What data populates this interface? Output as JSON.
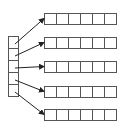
{
  "diagram": {
    "index_array": {
      "cells": 5,
      "x": 8,
      "y": 36,
      "cell_w": 10,
      "cell_h": 12
    },
    "rows": [
      {
        "index": 0,
        "y": 13,
        "cells": 6
      },
      {
        "index": 1,
        "y": 37,
        "cells": 6
      },
      {
        "index": 2,
        "y": 61,
        "cells": 6
      },
      {
        "index": 3,
        "y": 86,
        "cells": 6
      },
      {
        "index": 4,
        "y": 109,
        "cells": 6
      }
    ],
    "row_x": 44,
    "row_cell_w": 12,
    "row_cell_h": 11,
    "stroke_color": "#555555",
    "arrow_color": "#222222"
  }
}
